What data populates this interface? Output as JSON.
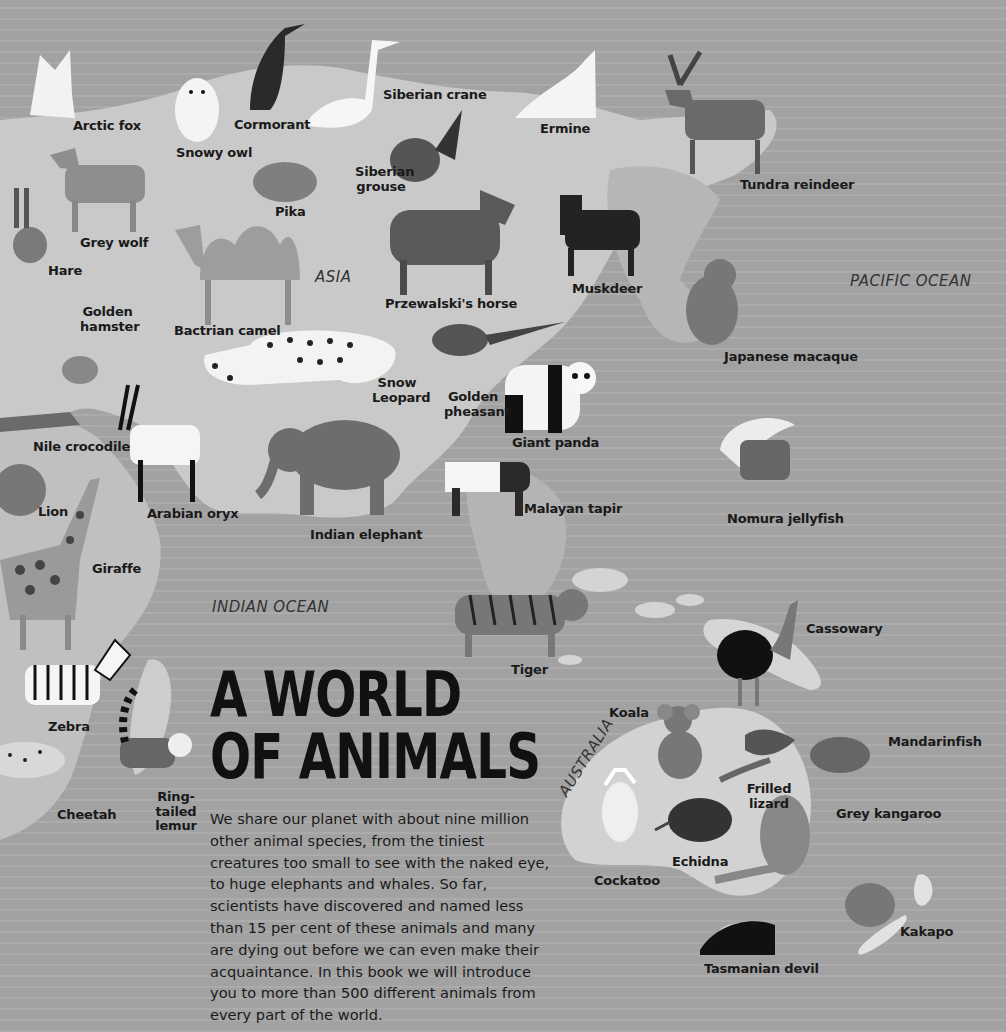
{
  "title": {
    "line1": "A WORLD",
    "line2": "OF ANIMALS"
  },
  "intro_text": "We share our planet with about nine million other animal species, from the tiniest creatures too small to see with the naked eye, to huge elephants and whales. So far, scientists have discovered and named less than 15 per cent of these animals and many are dying out before we can even make their acquaintance. In this book we will introduce you to more than 500 different animals from every part of the world.",
  "regions": {
    "asia": "ASIA",
    "pacific": "PACIFIC OCEAN",
    "indian": "INDIAN OCEAN",
    "australia": "AUSTRALIA"
  },
  "animals": {
    "arctic_fox": "Arctic fox",
    "snowy_owl": "Snowy owl",
    "cormorant": "Cormorant",
    "siberian_crane": "Siberian crane",
    "ermine": "Ermine",
    "tundra_reindeer": "Tundra reindeer",
    "siberian_grouse": "Siberian grouse",
    "grey_wolf": "Grey wolf",
    "pika": "Pika",
    "hare": "Hare",
    "golden_hamster": "Golden hamster",
    "bactrian_camel": "Bactrian camel",
    "przewalskis_horse": "Przewalski's horse",
    "muskdeer": "Muskdeer",
    "japanese_macaque": "Japanese macaque",
    "snow_leopard": "Snow Leopard",
    "golden_pheasant": "Golden pheasant",
    "giant_panda": "Giant panda",
    "nile_crocodile": "Nile crocodile",
    "arabian_oryx": "Arabian oryx",
    "lion": "Lion",
    "indian_elephant": "Indian elephant",
    "malayan_tapir": "Malayan tapir",
    "nomura_jellyfish": "Nomura jellyfish",
    "giraffe": "Giraffe",
    "tiger": "Tiger",
    "cassowary": "Cassowary",
    "zebra": "Zebra",
    "koala": "Koala",
    "mandarinfish": "Mandarinfish",
    "ring_tailed_lemur": "Ring-tailed lemur",
    "cheetah": "Cheetah",
    "frilled_lizard": "Frilled lizard",
    "grey_kangaroo": "Grey kangaroo",
    "echidna": "Echidna",
    "cockatoo": "Cockatoo",
    "kakapo": "Kakapo",
    "tasmanian_devil": "Tasmanian devil"
  }
}
